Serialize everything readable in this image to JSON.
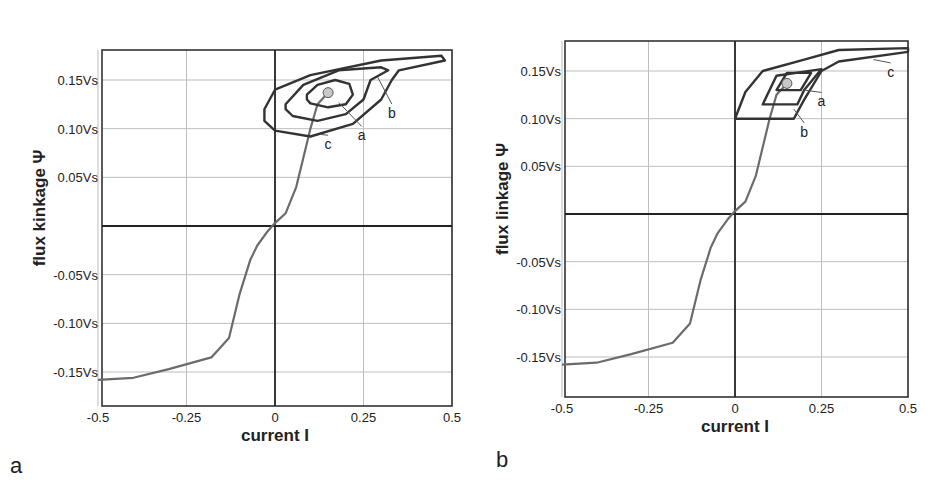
{
  "figure": {
    "panels": [
      "a",
      "b"
    ]
  },
  "chart_data": [
    {
      "type": "line",
      "panel_label": "a",
      "xlabel": "current   I",
      "ylabel": "flux kinkage   Ψ",
      "xlim": [
        -0.5,
        0.5
      ],
      "ylim": [
        -0.18,
        0.18
      ],
      "xticks": [
        -0.5,
        -0.25,
        0,
        0.25,
        0.5
      ],
      "xtick_labels": [
        "-0.5",
        "-0.25",
        "0",
        "0.25",
        "0.5"
      ],
      "yticks": [
        0.15,
        0.1,
        0.05,
        -0.05,
        -0.1,
        -0.15
      ],
      "ytick_labels": [
        "0.15Vs",
        "0.10Vs",
        "0.05Vs",
        "-0.05Vs",
        "-0.10Vs",
        "-0.15Vs"
      ],
      "grid": true,
      "operating_point": {
        "x": 0.15,
        "y": 0.137
      },
      "series": [
        {
          "name": "magnetization curve",
          "color": "#6b6b6b",
          "points": [
            [
              -0.5,
              -0.158
            ],
            [
              -0.4,
              -0.156
            ],
            [
              -0.3,
              -0.147
            ],
            [
              -0.18,
              -0.135
            ],
            [
              -0.13,
              -0.115
            ],
            [
              -0.1,
              -0.07
            ],
            [
              -0.07,
              -0.035
            ],
            [
              -0.05,
              -0.02
            ],
            [
              -0.02,
              -0.005
            ],
            [
              0,
              0.003
            ],
            [
              0.03,
              0.013
            ],
            [
              0.06,
              0.04
            ],
            [
              0.08,
              0.07
            ],
            [
              0.1,
              0.1
            ],
            [
              0.12,
              0.125
            ],
            [
              0.15,
              0.137
            ]
          ]
        },
        {
          "name": "a",
          "color": "#333333",
          "closed": true,
          "points": [
            [
              0.09,
              0.135
            ],
            [
              0.12,
              0.145
            ],
            [
              0.17,
              0.15
            ],
            [
              0.21,
              0.146
            ],
            [
              0.22,
              0.135
            ],
            [
              0.2,
              0.125
            ],
            [
              0.15,
              0.122
            ],
            [
              0.1,
              0.126
            ],
            [
              0.09,
              0.13
            ]
          ]
        },
        {
          "name": "b",
          "color": "#333333",
          "closed": true,
          "points": [
            [
              0.03,
              0.125
            ],
            [
              0.08,
              0.145
            ],
            [
              0.18,
              0.16
            ],
            [
              0.3,
              0.163
            ],
            [
              0.32,
              0.16
            ],
            [
              0.27,
              0.15
            ],
            [
              0.25,
              0.13
            ],
            [
              0.2,
              0.115
            ],
            [
              0.12,
              0.108
            ],
            [
              0.05,
              0.113
            ],
            [
              0.03,
              0.12
            ]
          ]
        },
        {
          "name": "c",
          "color": "#333333",
          "closed": true,
          "points": [
            [
              -0.03,
              0.12
            ],
            [
              0,
              0.14
            ],
            [
              0.1,
              0.155
            ],
            [
              0.3,
              0.17
            ],
            [
              0.47,
              0.175
            ],
            [
              0.48,
              0.17
            ],
            [
              0.35,
              0.16
            ],
            [
              0.33,
              0.15
            ],
            [
              0.3,
              0.13
            ],
            [
              0.22,
              0.105
            ],
            [
              0.1,
              0.092
            ],
            [
              0.0,
              0.098
            ],
            [
              -0.03,
              0.108
            ]
          ]
        }
      ],
      "annotations": [
        {
          "text": "a",
          "at": [
            0.245,
            0.092
          ],
          "from": [
            0.18,
            0.127
          ]
        },
        {
          "text": "b",
          "at": [
            0.33,
            0.115
          ],
          "from": [
            0.29,
            0.153
          ]
        },
        {
          "text": "c",
          "at": [
            0.15,
            0.083
          ],
          "from": [
            0.13,
            0.094
          ]
        }
      ]
    },
    {
      "type": "line",
      "panel_label": "b",
      "xlabel": "current   I",
      "ylabel": "flux linkage   Ψ",
      "xlim": [
        -0.5,
        0.5
      ],
      "ylim": [
        -0.18,
        0.18
      ],
      "xticks": [
        -0.5,
        -0.25,
        0,
        0.25,
        0.5
      ],
      "xtick_labels": [
        "-0.5",
        "-0.25",
        "0",
        "0.25",
        "0.5"
      ],
      "yticks": [
        0.15,
        0.1,
        0.05,
        -0.05,
        -0.1,
        -0.15
      ],
      "ytick_labels": [
        "0.15Vs",
        "0.10Vs",
        "0.05Vs",
        "-0.05Vs",
        "-0.10Vs",
        "-0.15Vs"
      ],
      "grid": true,
      "operating_point": {
        "x": 0.15,
        "y": 0.137
      },
      "series": [
        {
          "name": "magnetization curve",
          "color": "#6b6b6b",
          "points": [
            [
              -0.5,
              -0.158
            ],
            [
              -0.4,
              -0.156
            ],
            [
              -0.3,
              -0.147
            ],
            [
              -0.18,
              -0.135
            ],
            [
              -0.13,
              -0.115
            ],
            [
              -0.1,
              -0.07
            ],
            [
              -0.07,
              -0.035
            ],
            [
              -0.05,
              -0.02
            ],
            [
              -0.02,
              -0.005
            ],
            [
              0,
              0.003
            ],
            [
              0.03,
              0.013
            ],
            [
              0.06,
              0.04
            ],
            [
              0.08,
              0.07
            ],
            [
              0.1,
              0.1
            ],
            [
              0.12,
              0.125
            ],
            [
              0.15,
              0.137
            ]
          ]
        },
        {
          "name": "a",
          "color": "#333333",
          "closed": true,
          "points": [
            [
              0.12,
              0.13
            ],
            [
              0.15,
              0.148
            ],
            [
              0.22,
              0.148
            ],
            [
              0.19,
              0.13
            ],
            [
              0.12,
              0.13
            ]
          ]
        },
        {
          "name": "b",
          "color": "#333333",
          "closed": true,
          "points": [
            [
              0.08,
              0.115
            ],
            [
              0.12,
              0.145
            ],
            [
              0.25,
              0.152
            ],
            [
              0.2,
              0.13
            ],
            [
              0.18,
              0.115
            ],
            [
              0.08,
              0.115
            ]
          ]
        },
        {
          "name": "c",
          "color": "#333333",
          "closed": true,
          "points": [
            [
              0,
              0.1
            ],
            [
              0.03,
              0.128
            ],
            [
              0.08,
              0.15
            ],
            [
              0.2,
              0.162
            ],
            [
              0.3,
              0.172
            ],
            [
              0.5,
              0.174
            ],
            [
              0.5,
              0.17
            ],
            [
              0.3,
              0.16
            ],
            [
              0.25,
              0.15
            ],
            [
              0.2,
              0.12
            ],
            [
              0.17,
              0.1
            ],
            [
              0,
              0.1
            ]
          ]
        }
      ],
      "annotations": [
        {
          "text": "a",
          "at": [
            0.25,
            0.117
          ],
          "from": [
            0.2,
            0.13
          ]
        },
        {
          "text": "b",
          "at": [
            0.2,
            0.085
          ],
          "from": [
            0.17,
            0.11
          ]
        },
        {
          "text": "c",
          "at": [
            0.45,
            0.148
          ],
          "from": [
            0.4,
            0.162
          ]
        }
      ]
    }
  ],
  "panels_layout": [
    {
      "frame": {
        "left": 102,
        "top": 50,
        "right": 452,
        "bottom": 406
      },
      "x0": 275,
      "y0": 226,
      "panel_label_pos": [
        10,
        473
      ],
      "ylabel_x": 45,
      "xlabel_y": 441
    },
    {
      "frame": {
        "left": 565,
        "top": 41,
        "right": 908,
        "bottom": 397
      },
      "x0": 735,
      "y0": 214,
      "panel_label_pos": [
        496,
        467
      ],
      "ylabel_x": 508,
      "xlabel_y": 432
    }
  ]
}
